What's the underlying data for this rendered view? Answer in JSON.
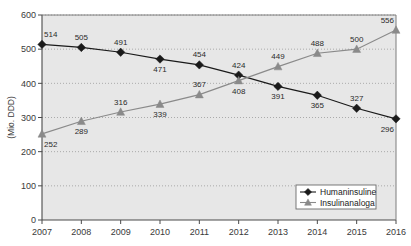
{
  "chart_data": {
    "type": "line",
    "title": "",
    "xlabel": "",
    "ylabel": "(Mio. DDD)",
    "categories": [
      "2007",
      "2008",
      "2009",
      "2010",
      "2011",
      "2012",
      "2013",
      "2014",
      "2015",
      "2016"
    ],
    "x": [
      2007,
      2008,
      2009,
      2010,
      2011,
      2012,
      2013,
      2014,
      2015,
      2016
    ],
    "ylim": [
      0,
      600
    ],
    "yticks": [
      0,
      100,
      200,
      300,
      400,
      500,
      600
    ],
    "ytick_labels": [
      "0",
      "100",
      "200",
      "300",
      "400",
      "500",
      "600"
    ],
    "grid": true,
    "legend_position": "bottom-right",
    "series": [
      {
        "name": "Humaninsuline",
        "marker": "diamond",
        "color": "#1a1a1a",
        "values": [
          514,
          505,
          491,
          471,
          454,
          424,
          391,
          365,
          327,
          296
        ],
        "labels": [
          "514",
          "505",
          "491",
          "471",
          "454",
          "424",
          "391",
          "365",
          "327",
          "296"
        ],
        "label_positions": [
          "above",
          "above",
          "above",
          "below",
          "above",
          "above",
          "below",
          "below",
          "above",
          "below"
        ]
      },
      {
        "name": "Insulinanaloga",
        "marker": "triangle",
        "color": "#8a8a8a",
        "values": [
          252,
          289,
          316,
          339,
          367,
          408,
          449,
          488,
          500,
          556
        ],
        "labels": [
          "252",
          "289",
          "316",
          "339",
          "367",
          "408",
          "449",
          "488",
          "500",
          "556"
        ],
        "label_positions": [
          "below",
          "below",
          "above",
          "below",
          "above",
          "below",
          "above",
          "above",
          "above",
          "above"
        ]
      }
    ]
  },
  "legend": {
    "items": [
      {
        "label": "Humaninsuline",
        "marker": "diamond",
        "color": "#1a1a1a"
      },
      {
        "label": "Insulinanaloga",
        "marker": "triangle",
        "color": "#8a8a8a"
      }
    ]
  },
  "colors": {
    "plot_background": "#e7e7e7",
    "page_background": "#ffffff",
    "gridline": "#9a9a9a",
    "axis": "#4a4a4a",
    "humaninsuline": "#1a1a1a",
    "insulinanaloga": "#8a8a8a",
    "legend_background": "#ffffff",
    "legend_border": "#6a6a6a"
  }
}
